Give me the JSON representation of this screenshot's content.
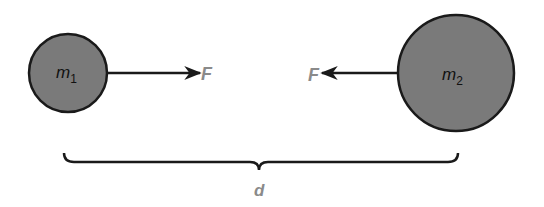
{
  "diagram": {
    "title": "",
    "masses": [
      {
        "id": "m1",
        "label_base": "m",
        "label_sub": "1",
        "fill": "#7a7a7a"
      },
      {
        "id": "m2",
        "label_base": "m",
        "label_sub": "2",
        "fill": "#7a7a7a"
      }
    ],
    "forces": [
      {
        "label": "F",
        "direction": "right",
        "from": "m1"
      },
      {
        "label": "F",
        "direction": "left",
        "from": "m2"
      }
    ],
    "distance": {
      "label": "d"
    },
    "colors": {
      "stroke": "#1a1a1a",
      "fill": "#7a7a7a",
      "label_gray": "#8a8a8a"
    }
  }
}
